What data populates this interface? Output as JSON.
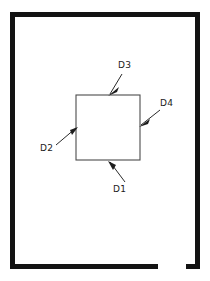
{
  "diagram": {
    "background_color": "#ffffff",
    "frame": {
      "name": "outer-frame",
      "color": "#131313",
      "thickness_px": 5,
      "left": 10,
      "top": 12,
      "right": 200,
      "bottom": 269,
      "has_bottom_gap": true,
      "gap_start_x": 158,
      "gap_end_x": 186
    },
    "shape": {
      "name": "inner-square",
      "stroke_color": "#4c4c4c",
      "fill": "none",
      "left": 76,
      "top": 95,
      "right": 140,
      "bottom": 160
    },
    "callouts": [
      {
        "id": "D1",
        "label": "D1",
        "points_to": "bottom-edge",
        "label_x": 113,
        "label_y": 192,
        "line_x1": 125,
        "line_y1": 182,
        "line_x2": 110,
        "line_y2": 162,
        "arrow_x": 108,
        "arrow_y": 161,
        "arrow_angle": 232
      },
      {
        "id": "D2",
        "label": "D2",
        "points_to": "left-edge",
        "label_x": 40,
        "label_y": 151,
        "line_x1": 56,
        "line_y1": 145,
        "line_x2": 76,
        "line_y2": 128,
        "arrow_x": 78,
        "arrow_y": 127,
        "arrow_angle": 320
      },
      {
        "id": "D3",
        "label": "D3",
        "points_to": "top-edge",
        "label_x": 118,
        "label_y": 68,
        "line_x1": 122,
        "line_y1": 74,
        "line_x2": 110,
        "line_y2": 94,
        "arrow_x": 108,
        "arrow_y": 96,
        "arrow_angle": 122
      },
      {
        "id": "D4",
        "label": "D4",
        "points_to": "right-edge",
        "label_x": 160,
        "label_y": 106,
        "line_x1": 160,
        "line_y1": 110,
        "line_x2": 141,
        "line_y2": 125,
        "arrow_x": 139,
        "arrow_y": 127,
        "arrow_angle": 142
      }
    ]
  }
}
